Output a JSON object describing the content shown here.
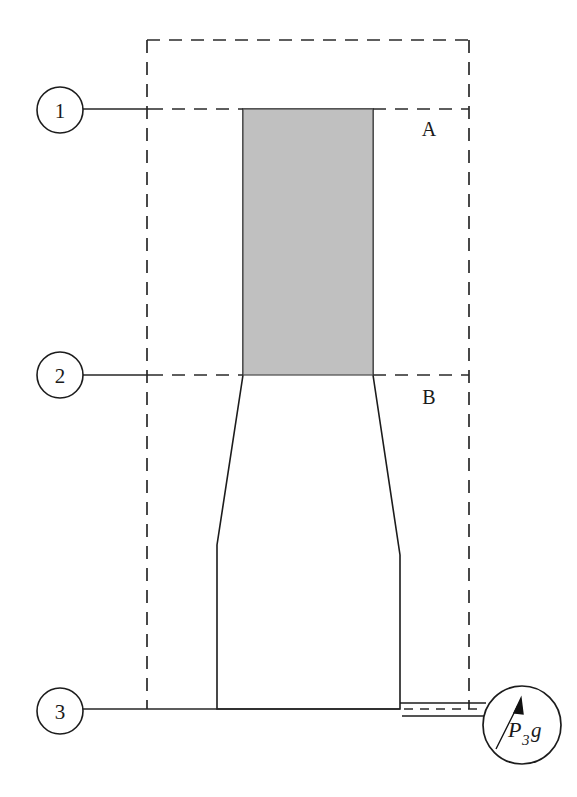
{
  "figure": {
    "kind": "engineering-schematic",
    "background_color": "#ffffff",
    "line_color": "#1c1c1c",
    "shading_color": "#c0c0c0"
  },
  "stations": [
    {
      "id": "station-1",
      "label": "1",
      "cx": 60,
      "cy": 110,
      "r": 23,
      "leader_to_x": 147
    },
    {
      "id": "station-2",
      "label": "2",
      "cx": 60,
      "cy": 375,
      "r": 23,
      "leader_to_x": 147
    },
    {
      "id": "station-3",
      "label": "3",
      "cx": 60,
      "cy": 711,
      "r": 23,
      "leader_to_x": 147
    }
  ],
  "plane_labels": [
    {
      "id": "plane-a",
      "label": "A",
      "x": 429,
      "y": 136
    },
    {
      "id": "plane-b",
      "label": "B",
      "x": 429,
      "y": 404
    }
  ],
  "control_volume": {
    "label": "dashed control volume boundary",
    "left": 147,
    "right": 469,
    "top": 40,
    "bottom": 709
  },
  "shaded_column": {
    "label": "shaded fluid column",
    "left": 243,
    "right": 373,
    "top": 109,
    "bottom": 375,
    "fill": "#c0c0c0"
  },
  "gauge": {
    "id": "pressure-gauge",
    "cx": 522,
    "cy": 725,
    "r": 39,
    "symbol_main": "P",
    "symbol_sub": "3",
    "symbol_suffix": "g",
    "full_text": "P3g",
    "needle_direction": "up-right"
  },
  "section_lines": [
    {
      "id": "section-line-1",
      "y": 109,
      "from_x": 83,
      "to_x": 469
    },
    {
      "id": "section-line-2",
      "y": 375,
      "from_x": 83,
      "to_x": 469
    },
    {
      "id": "section-line-3",
      "y": 709,
      "from_x": 83,
      "to_x": 484
    }
  ]
}
